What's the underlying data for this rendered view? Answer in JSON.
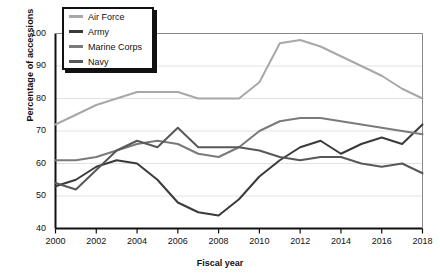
{
  "chart_data": {
    "type": "line",
    "title": "",
    "xlabel": "Fiscal year",
    "ylabel": "Percentage of accessions",
    "xlim": [
      2000,
      2018
    ],
    "ylim": [
      40,
      100
    ],
    "yticks": [
      40,
      50,
      60,
      70,
      80,
      90,
      100
    ],
    "xticks": [
      2000,
      2002,
      2004,
      2006,
      2008,
      2010,
      2012,
      2014,
      2016,
      2018
    ],
    "x": [
      2000,
      2001,
      2002,
      2003,
      2004,
      2005,
      2006,
      2007,
      2008,
      2009,
      2010,
      2011,
      2012,
      2013,
      2014,
      2015,
      2016,
      2017,
      2018
    ],
    "grid": "horizontal",
    "legend_position": "top-left",
    "series": [
      {
        "name": "Air Force",
        "color": "#a8a8a8",
        "values": [
          72,
          75,
          78,
          80,
          82,
          82,
          82,
          80,
          80,
          80,
          85,
          97,
          98,
          96,
          93,
          90,
          87,
          83,
          80
        ]
      },
      {
        "name": "Army",
        "color": "#3a3a3a",
        "values": [
          53,
          55,
          59,
          61,
          60,
          55,
          48,
          45,
          44,
          49,
          56,
          61,
          65,
          67,
          63,
          66,
          68,
          66,
          72
        ]
      },
      {
        "name": "Marine Corps",
        "color": "#7a7a7a",
        "values": [
          61,
          61,
          62,
          64,
          66,
          67,
          66,
          63,
          62,
          65,
          70,
          73,
          74,
          74,
          73,
          72,
          71,
          70,
          69
        ]
      },
      {
        "name": "Navy",
        "color": "#585858",
        "values": [
          54,
          52,
          58,
          64,
          67,
          65,
          71,
          65,
          65,
          65,
          64,
          62,
          61,
          62,
          62,
          60,
          59,
          60,
          57
        ]
      }
    ]
  },
  "axes": {
    "ytick_labels": [
      "100",
      "90",
      "80",
      "70",
      "60",
      "50",
      "40"
    ],
    "xtick_labels": [
      "2000",
      "2002",
      "2004",
      "2006",
      "2008",
      "2010",
      "2012",
      "2014",
      "2016",
      "2018"
    ],
    "y_axis_title": "Percentage of accessions",
    "x_axis_title": "Fiscal year"
  },
  "legend": {
    "items": [
      {
        "label": "Air Force"
      },
      {
        "label": "Army"
      },
      {
        "label": "Marine Corps"
      },
      {
        "label": "Navy"
      }
    ]
  }
}
